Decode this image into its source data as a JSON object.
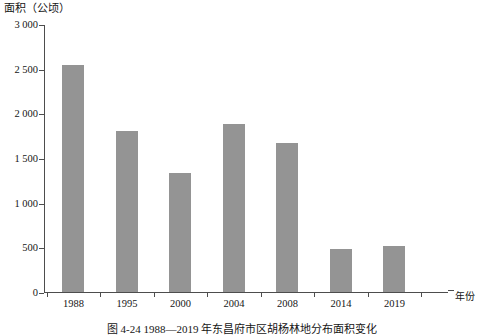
{
  "chart_data": {
    "type": "bar",
    "title": "",
    "caption": "图 4-24  1988—2019 年东昌府市区胡杨林地分布面积变化",
    "ylabel": "面积（公顷）",
    "xlabel": "年份",
    "categories": [
      "1988",
      "1995",
      "2000",
      "2004",
      "2008",
      "2014",
      "2019"
    ],
    "values": [
      2545,
      1800,
      1330,
      1880,
      1670,
      480,
      520
    ],
    "ylim": [
      0,
      3000
    ],
    "yticks": [
      0,
      500,
      1000,
      1500,
      2000,
      2500,
      3000
    ],
    "ytick_labels": [
      "0",
      "500",
      "1 000",
      "1 500",
      "2 000",
      "2 500",
      "3 000"
    ],
    "grid": false,
    "legend": null,
    "bar_color": "#949494",
    "axis_color": "#4d4d4d"
  }
}
